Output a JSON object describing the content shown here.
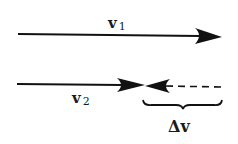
{
  "diagram": {
    "type": "vector-difference",
    "vectors": [
      {
        "id": "v1",
        "label": "v",
        "subscript": "1",
        "style": "solid",
        "direction": "right"
      },
      {
        "id": "v2",
        "label": "v",
        "subscript": "2",
        "style": "solid",
        "direction": "right"
      },
      {
        "id": "delta_v",
        "label": "Δv",
        "style": "dashed",
        "direction": "left"
      }
    ],
    "brace_label": "Δv",
    "colors": {
      "stroke": "#111111",
      "background": "#ffffff"
    }
  }
}
